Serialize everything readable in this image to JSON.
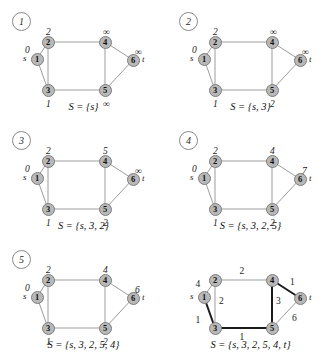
{
  "figure": {
    "node_labels": [
      "1",
      "2",
      "3",
      "4",
      "5",
      "6"
    ],
    "source_marker": "s",
    "target_marker": "t",
    "infinity_symbol": "∞"
  },
  "geometry": {
    "nodes": {
      "n1": {
        "x": 37,
        "y": 59
      },
      "n2": {
        "x": 48,
        "y": 42
      },
      "n3": {
        "x": 48,
        "y": 90
      },
      "n4": {
        "x": 105,
        "y": 42
      },
      "n5": {
        "x": 105,
        "y": 90
      },
      "n6": {
        "x": 133,
        "y": 60
      }
    },
    "edges": [
      {
        "from": "n1",
        "to": "n2"
      },
      {
        "from": "n1",
        "to": "n3"
      },
      {
        "from": "n2",
        "to": "n3"
      },
      {
        "from": "n2",
        "to": "n4"
      },
      {
        "from": "n3",
        "to": "n5"
      },
      {
        "from": "n4",
        "to": "n5"
      },
      {
        "from": "n4",
        "to": "n6"
      },
      {
        "from": "n5",
        "to": "n6"
      }
    ]
  },
  "panels": [
    {
      "number": "1",
      "caption": "S = {s}",
      "distances": {
        "n1": "0",
        "n2": "2",
        "n3": "1",
        "n4": "∞",
        "n5": "∞",
        "n6": "∞"
      },
      "bold_edges": []
    },
    {
      "number": "2",
      "caption": "S = {s, 3}",
      "distances": {
        "n1": "0",
        "n2": "2",
        "n3": "1",
        "n4": "∞",
        "n5": "2",
        "n6": "∞"
      },
      "bold_edges": []
    },
    {
      "number": "3",
      "caption": "S = {s, 3, 2}",
      "distances": {
        "n1": "0",
        "n2": "2",
        "n3": "1",
        "n4": "5",
        "n5": "2",
        "n6": "∞"
      },
      "bold_edges": []
    },
    {
      "number": "4",
      "caption": "S = {s, 3, 2, 5}",
      "distances": {
        "n1": "0",
        "n2": "2",
        "n3": "1",
        "n4": "4",
        "n5": "2",
        "n6": "7"
      },
      "bold_edges": []
    },
    {
      "number": "5",
      "caption": "S = {s, 3, 2, 5, 4}",
      "distances": {
        "n1": "0",
        "n2": "2",
        "n3": "1",
        "n4": "4",
        "n5": "2",
        "n6": "6"
      },
      "bold_edges": []
    },
    {
      "number": "",
      "caption": "S = {s, 3, 2, 5, 4, t}",
      "weights": {
        "n1_n2": "4",
        "n1_n3": "1",
        "n2_n3": "2",
        "n2_n4": "2",
        "n3_n5": "1",
        "n4_n5": "3",
        "n4_n6": "1",
        "n5_n6": "6"
      },
      "bold_edges": [
        "n1_n3",
        "n3_n5",
        "n4_n5",
        "n4_n6"
      ]
    }
  ],
  "chart_data": {
    "type": "diagram",
    "graph": {
      "directed": false,
      "nodes": [
        "1",
        "2",
        "3",
        "4",
        "5",
        "6"
      ],
      "source": "1",
      "sink": "6",
      "edges": [
        {
          "u": "1",
          "v": "2",
          "w": 4
        },
        {
          "u": "1",
          "v": "3",
          "w": 1
        },
        {
          "u": "2",
          "v": "3",
          "w": 2
        },
        {
          "u": "2",
          "v": "4",
          "w": 2
        },
        {
          "u": "3",
          "v": "5",
          "w": 1
        },
        {
          "u": "4",
          "v": "5",
          "w": 3
        },
        {
          "u": "4",
          "v": "6",
          "w": 1
        },
        {
          "u": "5",
          "v": "6",
          "w": 6
        }
      ]
    },
    "steps": [
      {
        "step": 1,
        "S": [
          "s"
        ],
        "d": {
          "1": 0,
          "2": 2,
          "3": 1,
          "4": null,
          "5": null,
          "6": null
        }
      },
      {
        "step": 2,
        "S": [
          "s",
          "3"
        ],
        "d": {
          "1": 0,
          "2": 2,
          "3": 1,
          "4": null,
          "5": 2,
          "6": null
        }
      },
      {
        "step": 3,
        "S": [
          "s",
          "3",
          "2"
        ],
        "d": {
          "1": 0,
          "2": 2,
          "3": 1,
          "4": 5,
          "5": 2,
          "6": null
        }
      },
      {
        "step": 4,
        "S": [
          "s",
          "3",
          "2",
          "5"
        ],
        "d": {
          "1": 0,
          "2": 2,
          "3": 1,
          "4": 4,
          "5": 2,
          "6": 7
        }
      },
      {
        "step": 5,
        "S": [
          "s",
          "3",
          "2",
          "5",
          "4"
        ],
        "d": {
          "1": 0,
          "2": 2,
          "3": 1,
          "4": 4,
          "5": 2,
          "6": 6
        }
      },
      {
        "step": 6,
        "S": [
          "s",
          "3",
          "2",
          "5",
          "4",
          "t"
        ],
        "shortest_path_tree": [
          [
            "1",
            "3"
          ],
          [
            "3",
            "5"
          ],
          [
            "5",
            "4"
          ],
          [
            "4",
            "6"
          ]
        ]
      }
    ]
  }
}
